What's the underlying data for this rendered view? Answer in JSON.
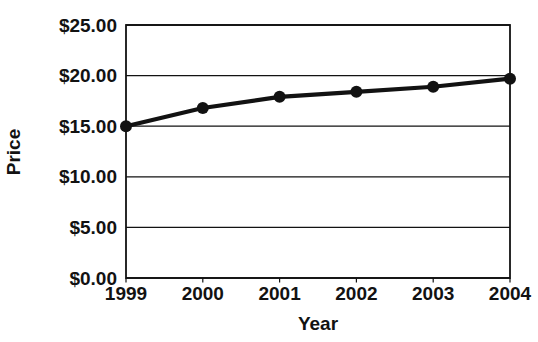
{
  "figure": {
    "background": "#ffffff",
    "ink_color": "#121212"
  },
  "chart_data": {
    "type": "line",
    "title": "",
    "xlabel": "Year",
    "ylabel": "Price",
    "categories": [
      "1999",
      "2000",
      "2001",
      "2002",
      "2003",
      "2004"
    ],
    "series": [
      {
        "name": "Price",
        "values": [
          15.0,
          16.8,
          17.9,
          18.4,
          18.9,
          19.7
        ]
      }
    ],
    "y_ticks": [
      0,
      5,
      10,
      15,
      20,
      25
    ],
    "y_tick_labels": [
      "$0.00",
      "$5.00",
      "$10.00",
      "$15.00",
      "$20.00",
      "$25.00"
    ],
    "ylim": [
      0,
      25
    ],
    "grid": "horizontal",
    "legend": "none",
    "marker": "filled-circle",
    "line_color": "#121212",
    "marker_color": "#121212"
  }
}
